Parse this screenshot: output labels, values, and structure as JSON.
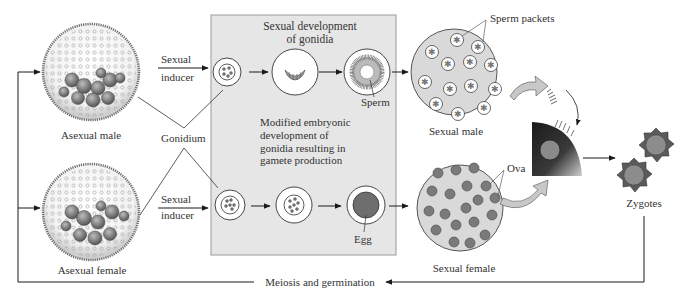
{
  "diagram": {
    "type": "life-cycle",
    "colors": {
      "panel_fill": "#e6e6e6",
      "panel_border": "#9a9a9a",
      "arrow": "#1a1a1a",
      "sexual_colony_fill": "#d9d9d9",
      "ova_fill": "#7a7a7a",
      "egg_fill": "#6e6e6e",
      "zygote_fill": "#5a5a5a",
      "transfer_arrow_fill": "#c8c8c8"
    }
  },
  "labels": {
    "asexual_male": "Asexual male",
    "asexual_female": "Asexual female",
    "sexual_inducer_top_line1": "Sexual",
    "sexual_inducer_top_line2": "inducer",
    "sexual_inducer_bottom_line1": "Sexual",
    "sexual_inducer_bottom_line2": "inducer",
    "gonidium": "Gonidium",
    "panel_title_line1": "Sexual development",
    "panel_title_line2": "of gonidia",
    "sperm": "Sperm",
    "modified_line1": "Modified embryonic",
    "modified_line2": "development of",
    "modified_line3": "gonidia resulting in",
    "modified_line4": "gamete production",
    "egg": "Egg",
    "sperm_packets": "Sperm packets",
    "sexual_male": "Sexual male",
    "ova": "Ova",
    "sexual_female": "Sexual female",
    "zygotes": "Zygotes",
    "meiosis": "Meiosis and germination"
  }
}
